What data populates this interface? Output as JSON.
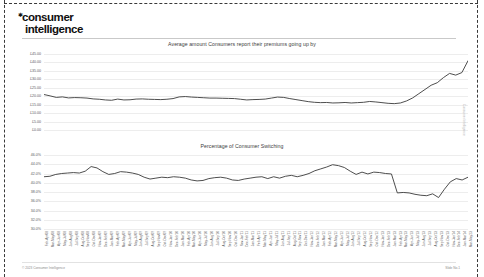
{
  "brand": {
    "line1": "consumer",
    "line2": "intelligence",
    "asterisk": "sparkle-mark"
  },
  "footer": {
    "copyright": "© 2023 Consumer Intelligence",
    "slide_marker": "Slide No.1",
    "edge_note": "Consumer Intelligence"
  },
  "chart_data": [
    {
      "type": "line",
      "title": "Average amount Consumers report their premiums going up by",
      "xlabel": "",
      "ylabel": "",
      "ylim": [
        0,
        45
      ],
      "grid": true,
      "legend_position": "none",
      "line_color": "#3a3a3a",
      "ytick_labels": [
        "£45.00",
        "£40.00",
        "£35.00",
        "£30.00",
        "£25.00",
        "£20.00",
        "£15.00",
        "£10.00",
        "£5.00",
        "£0.00"
      ],
      "ytick_values": [
        45,
        40,
        35,
        30,
        25,
        20,
        15,
        10,
        5,
        0
      ],
      "values": [
        21.0,
        20.2,
        19.3,
        19.6,
        19.0,
        19.2,
        19.1,
        18.9,
        18.4,
        18.2,
        17.8,
        17.6,
        18.3,
        17.8,
        17.9,
        18.3,
        18.4,
        18.2,
        18.1,
        18.0,
        18.2,
        18.6,
        19.6,
        19.8,
        19.5,
        19.3,
        19.1,
        18.9,
        18.9,
        18.8,
        18.7,
        18.6,
        18.2,
        17.8,
        18.0,
        18.1,
        18.3,
        18.9,
        19.5,
        19.3,
        18.6,
        18.0,
        17.4,
        16.8,
        16.4,
        16.2,
        16.3,
        16.0,
        16.1,
        16.3,
        16.0,
        16.2,
        16.4,
        16.9,
        16.6,
        16.2,
        15.8,
        15.6,
        16.0,
        17.2,
        19.0,
        21.5,
        24.0,
        26.5,
        28.0,
        31.0,
        33.5,
        32.5,
        34.0,
        41.0
      ]
    },
    {
      "type": "line",
      "title": "Percentage of Consumer Switching",
      "xlabel": "",
      "ylabel": "",
      "ylim": [
        30.0,
        46.0
      ],
      "grid": true,
      "legend_position": "none",
      "line_color": "#3a3a3a",
      "ytick_labels": [
        "46.0%",
        "44.0%",
        "42.0%",
        "40.0%",
        "38.0%",
        "36.0%",
        "34.0%",
        "32.0%",
        "30.0%"
      ],
      "ytick_values": [
        46.0,
        44.0,
        42.0,
        40.0,
        38.0,
        36.0,
        34.0,
        32.0,
        30.0
      ],
      "values": [
        41.3,
        41.4,
        41.8,
        42.0,
        42.1,
        42.2,
        42.1,
        42.5,
        43.5,
        43.2,
        42.4,
        41.8,
        42.0,
        42.4,
        42.3,
        42.1,
        41.8,
        41.2,
        40.8,
        41.0,
        41.2,
        41.1,
        41.3,
        41.2,
        41.0,
        40.6,
        40.4,
        40.5,
        40.9,
        41.1,
        41.2,
        41.0,
        40.6,
        40.5,
        40.8,
        41.0,
        41.2,
        41.3,
        40.9,
        41.3,
        41.0,
        41.4,
        41.6,
        41.3,
        41.6,
        42.0,
        42.6,
        43.0,
        43.4,
        43.9,
        43.7,
        43.3,
        42.5,
        41.8,
        42.3,
        41.9,
        42.3,
        42.2,
        42.0,
        41.9,
        37.8,
        37.9,
        37.8,
        37.5,
        37.3,
        37.2,
        37.6,
        36.8,
        38.6,
        40.2,
        40.9,
        40.6,
        41.2
      ],
      "tick_labels": [
        "Feb-Apr'08",
        "Mar-May'08",
        "Apr-Jun'08",
        "May-Jul'08",
        "Jun-Aug'08",
        "Jul-Sep'08",
        "Aug-Oct'08",
        "Sep-Nov'08",
        "Oct-Dec'08",
        "Nov-Jan'09",
        "Dec-Feb'09",
        "Jan-Mar'09",
        "Feb-Apr'09",
        "Mar-May'09",
        "Apr-Jun'09",
        "May-Jul'09",
        "Jun-Aug'09",
        "Jul-Sep'09",
        "Aug-Oct'09",
        "Sep-Nov'09",
        "Oct-Dec'09",
        "Nov-Jan'10",
        "Dec-Feb'10",
        "Jan-Mar'10",
        "Feb-Apr'10",
        "Mar-May'10",
        "Apr-Jun'10",
        "May-Jul'10",
        "Jun-Aug'10",
        "Jul-Sep'10",
        "Aug-Oct'10",
        "Sep-Nov'10",
        "Oct-Dec'10",
        "Nov-Jan'11",
        "Dec-Feb'11",
        "Jan-Mar'11",
        "Feb-Apr'11",
        "Mar-May'11",
        "Apr-Jun'11",
        "May-Jul'11",
        "Jun-Aug'11",
        "Jul-Sep'11",
        "Aug-Oct'11",
        "Sep-Nov'11",
        "Oct-Dec'11",
        "Nov-Jan'12",
        "Dec-Feb'12",
        "Jan-Mar'12",
        "Feb-Apr'12",
        "Mar-May'12",
        "Apr-Jun'12",
        "May-Jul'12",
        "Jun-Aug'12",
        "Jul-Sep'12",
        "Aug-Oct'12",
        "Sep-Nov'12",
        "Oct-Dec'12",
        "Nov-Jan'13",
        "Dec-Feb'13",
        "Jan-Mar'13",
        "Feb-Apr'13",
        "Mar-May'13",
        "Apr-Jun'13",
        "May-Jul'13",
        "Jun-Aug'13",
        "Jul-Sep'13",
        "Aug-Oct'13",
        "Sep-Nov'13",
        "Oct-Dec'13",
        "Nov-Jan'14",
        "Dec-Feb'14",
        "Jan-Mar'14",
        "Mar-May'23"
      ]
    }
  ]
}
